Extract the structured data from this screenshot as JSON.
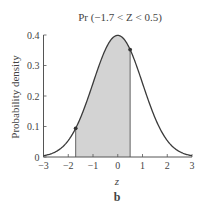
{
  "chart_data": {
    "type": "area",
    "title": "Pr (−1.7 < Z < 0.5)",
    "xlabel": "z",
    "ylabel": "Probability density",
    "panel_label": "b",
    "xlim": [
      -3,
      3
    ],
    "ylim": [
      0,
      0.4
    ],
    "x_ticks": [
      -3,
      -2,
      -1,
      0,
      1,
      2,
      3
    ],
    "x_tick_labels": [
      "−3",
      "−2",
      "−1",
      "0",
      "1",
      "2",
      "3"
    ],
    "y_ticks": [
      0,
      0.1,
      0.2,
      0.3,
      0.4
    ],
    "y_tick_labels": [
      "0",
      "0.1",
      "0.2",
      "0.3",
      "0.4"
    ],
    "grid": false,
    "legend": null,
    "series": [
      {
        "name": "Standard normal density",
        "function": "normal_pdf(mean=0, sd=1)",
        "x": [
          -3,
          -2.5,
          -2,
          -1.7,
          -1.5,
          -1,
          -0.5,
          0,
          0.5,
          1,
          1.5,
          2,
          2.5,
          3
        ],
        "values": [
          0.004,
          0.018,
          0.054,
          0.094,
          0.13,
          0.242,
          0.352,
          0.399,
          0.352,
          0.242,
          0.13,
          0.054,
          0.018,
          0.004
        ]
      }
    ],
    "shaded_region": {
      "from": -1.7,
      "to": 0.5,
      "color": "#d3d3d3"
    },
    "marked_points": [
      {
        "x": -1.7,
        "y": 0.094
      },
      {
        "x": 0.5,
        "y": 0.352
      }
    ],
    "colors": {
      "curve": "#3a3a3a",
      "axis": "#555555",
      "fill": "#d3d3d3"
    }
  }
}
